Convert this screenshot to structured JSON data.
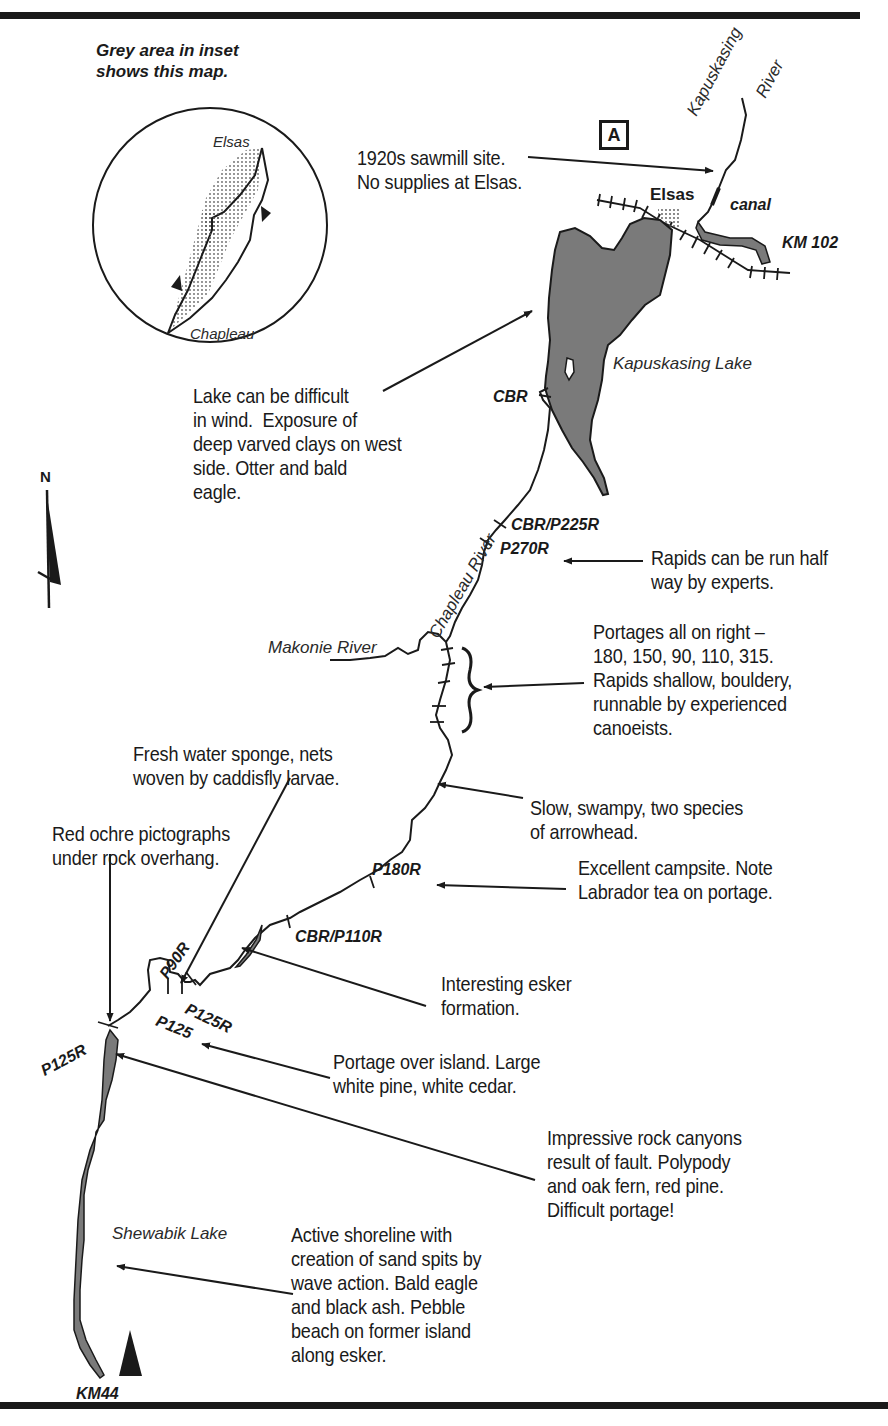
{
  "header": {
    "title_fragment": "",
    "map_label": "A"
  },
  "inset": {
    "caption": "Grey area in inset\nshows this map.",
    "labels": {
      "north": "Elsas",
      "south": "Chapleau"
    }
  },
  "compass": {
    "north_label": "N"
  },
  "places": {
    "elsas": "Elsas",
    "canal": "canal",
    "km_north": "KM 102",
    "km_south": "KM44",
    "kapuskasing_river": "Kapuskasing",
    "kapuskasing_river_2": "River",
    "kapuskasing_lake": "Kapuskasing Lake",
    "chapleau_river": "Chapleau River",
    "makonie_river": "Makonie River",
    "shewabik_lake": "Shewabik Lake"
  },
  "portage_labels": [
    {
      "id": "cbr",
      "text": "CBR"
    },
    {
      "id": "cbr_p225r",
      "text": "CBR/P225R"
    },
    {
      "id": "p270r",
      "text": "P270R"
    },
    {
      "id": "p180r",
      "text": "P180R"
    },
    {
      "id": "cbr_p110r",
      "text": "CBR/P110R"
    },
    {
      "id": "p90r",
      "text": "P90R"
    },
    {
      "id": "p125r_a",
      "text": "P125R"
    },
    {
      "id": "p125",
      "text": "P125"
    },
    {
      "id": "p125r_b",
      "text": "P125R"
    }
  ],
  "annotations": [
    {
      "id": "sawmill",
      "text": "1920s sawmill site.\nNo supplies at Elsas."
    },
    {
      "id": "lake-wind",
      "text": "Lake can be difficult\nin wind.  Exposure of\ndeep varved clays on west\nside. Otter and bald\neagle."
    },
    {
      "id": "rapids-half",
      "text": "Rapids can be run half\nway by experts."
    },
    {
      "id": "portages-right",
      "text": "Portages all on right –\n180, 150, 90, 110, 315.\nRapids shallow, bouldery,\nrunnable by experienced\ncanoeists."
    },
    {
      "id": "sponge",
      "text": "Fresh water sponge, nets\nwoven by caddisfly larvae."
    },
    {
      "id": "swampy",
      "text": "Slow, swampy, two species\nof arrowhead."
    },
    {
      "id": "pictographs",
      "text": "Red ochre pictographs\nunder rock overhang."
    },
    {
      "id": "campsite",
      "text": "Excellent campsite. Note\nLabrador tea on portage."
    },
    {
      "id": "esker",
      "text": "Interesting esker\nformation."
    },
    {
      "id": "island",
      "text": "Portage over island. Large\nwhite pine, white cedar."
    },
    {
      "id": "canyons",
      "text": "Impressive rock canyons\nresult of fault. Polypody\nand oak fern, red pine.\nDifficult portage!"
    },
    {
      "id": "shoreline",
      "text": "Active shoreline with\ncreation of sand spits by\nwave action. Bald eagle\nand black ash. Pebble\nbeach on former island\nalong esker."
    }
  ],
  "colors": {
    "ink": "#1a1a1a",
    "water": "#7a7a7a",
    "paper": "#ffffff"
  }
}
